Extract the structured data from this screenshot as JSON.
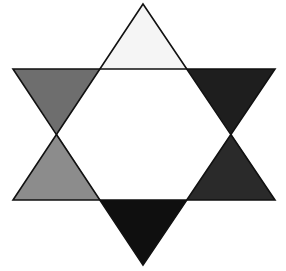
{
  "diagram": {
    "type": "six-pointed-star",
    "center_hexagon": {
      "fill": "#ffffff",
      "points": "100,69 187,69 231,134 187,200 100,200 57,134"
    },
    "points": [
      {
        "name": "top",
        "fill": "#f5f5f5",
        "points": "143,4 187,69 100,69"
      },
      {
        "name": "upper-right",
        "fill": "#1e1e1e",
        "points": "187,69 275,69 231,134"
      },
      {
        "name": "lower-right",
        "fill": "#2a2a2a",
        "points": "231,134 275,200 187,200"
      },
      {
        "name": "bottom",
        "fill": "#0f0f0f",
        "points": "187,200 143,265 100,200"
      },
      {
        "name": "lower-left",
        "fill": "#8c8c8c",
        "points": "100,200 13,200 57,134"
      },
      {
        "name": "upper-left",
        "fill": "#6e6e6e",
        "points": "57,134 13,69 100,69"
      }
    ],
    "outline": {
      "stroke": "#111111",
      "up_triangle": "143,4 275,200 13,200",
      "down_triangle": "13,69 275,69 143,265"
    }
  }
}
